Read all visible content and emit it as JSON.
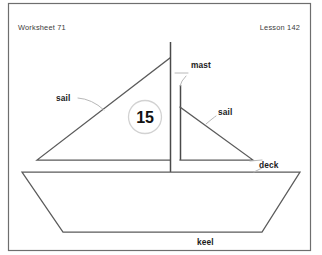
{
  "worksheet": {
    "header_left": "Worksheet 71",
    "header_right": "Lesson 142",
    "marker_number": "15",
    "frame_color": "#6e6e6e",
    "line_color": "#5b5b5b",
    "leader_color": "#b8b8b8",
    "background": "#ffffff"
  },
  "labels": {
    "mast": "mast",
    "sail_left": "sail",
    "sail_right": "sail",
    "deck": "deck",
    "keel": "keel"
  },
  "diagram": {
    "type": "labeled-parts-diagram",
    "parts": [
      {
        "name": "sail",
        "label": "sail",
        "position": "left"
      },
      {
        "name": "mast",
        "label": "mast",
        "position": "center-top"
      },
      {
        "name": "sail",
        "label": "sail",
        "position": "right"
      },
      {
        "name": "deck",
        "label": "deck",
        "position": "right-middle"
      },
      {
        "name": "keel",
        "label": "keel",
        "position": "bottom-center"
      }
    ]
  }
}
